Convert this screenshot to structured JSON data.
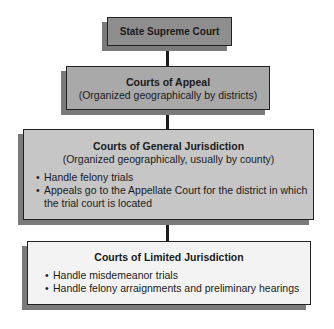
{
  "diagram": {
    "type": "hierarchy",
    "levels": [
      {
        "title": "State Supreme Court",
        "subtitle": null,
        "bullets": [],
        "fill": "#8e8e8e"
      },
      {
        "title": "Courts of Appeal",
        "subtitle": "(Organized geographically by districts)",
        "bullets": [],
        "fill": "#a9a9a9"
      },
      {
        "title": "Courts of General Jurisdiction",
        "subtitle": "(Organized geographically, usually by county)",
        "bullets": [
          "Handle felony trials",
          "Appeals go to the Appellate Court for the district in which the trial court is located"
        ],
        "fill": "#c6c6c6"
      },
      {
        "title": "Courts of Limited Jurisdiction",
        "subtitle": null,
        "bullets": [
          "Handle misdemeanor trials",
          "Handle felony arraignments and preliminary hearings"
        ],
        "fill": "#f3f3f3"
      }
    ],
    "connectors": [
      {
        "from": 0,
        "to": 1
      },
      {
        "from": 1,
        "to": 2
      },
      {
        "from": 2,
        "to": 3
      }
    ]
  }
}
